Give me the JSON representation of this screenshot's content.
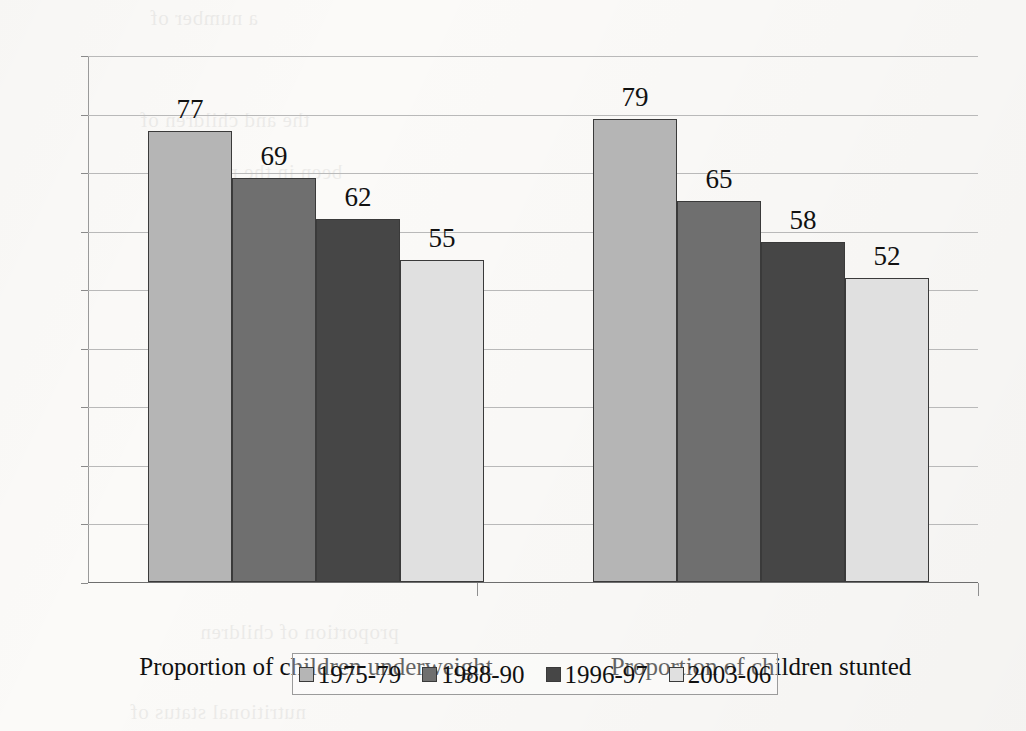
{
  "chart_data": {
    "type": "bar",
    "title": "",
    "subtitle": "",
    "xlabel": "",
    "ylabel": "",
    "ylim": [
      0,
      90
    ],
    "ytick_step": 10,
    "yticks": [
      "90",
      "80",
      "70",
      "60",
      "50",
      "40",
      "30",
      "20",
      "10",
      "0"
    ],
    "grid": true,
    "legend_position": "bottom",
    "categories": [
      "Proportion of children underweight",
      "Proportion of children stunted"
    ],
    "series": [
      {
        "name": "1975-79",
        "color": "#b5b5b5",
        "values": [
          77,
          79
        ]
      },
      {
        "name": "1988-90",
        "color": "#6f6f6f",
        "values": [
          69,
          65
        ]
      },
      {
        "name": "1996-97",
        "color": "#464646",
        "values": [
          62,
          58
        ]
      },
      {
        "name": "2003-06",
        "color": "#e0e0e0",
        "values": [
          55,
          52
        ]
      }
    ],
    "data_labels": [
      [
        "77",
        "69",
        "62",
        "55"
      ],
      [
        "79",
        "65",
        "58",
        "52"
      ]
    ]
  },
  "legend": {
    "items": [
      {
        "label": "1975-79",
        "color": "#b5b5b5"
      },
      {
        "label": "1988-90",
        "color": "#6f6f6f"
      },
      {
        "label": "1996-97",
        "color": "#464646"
      },
      {
        "label": "2003-06",
        "color": "#e0e0e0"
      }
    ]
  },
  "scan_artifacts": {
    "bleed_lines": [
      "a number of",
      "the and children of",
      "been in the nutrition",
      "estimates stunting",
      "proportion of children",
      "nutritional status of"
    ]
  }
}
